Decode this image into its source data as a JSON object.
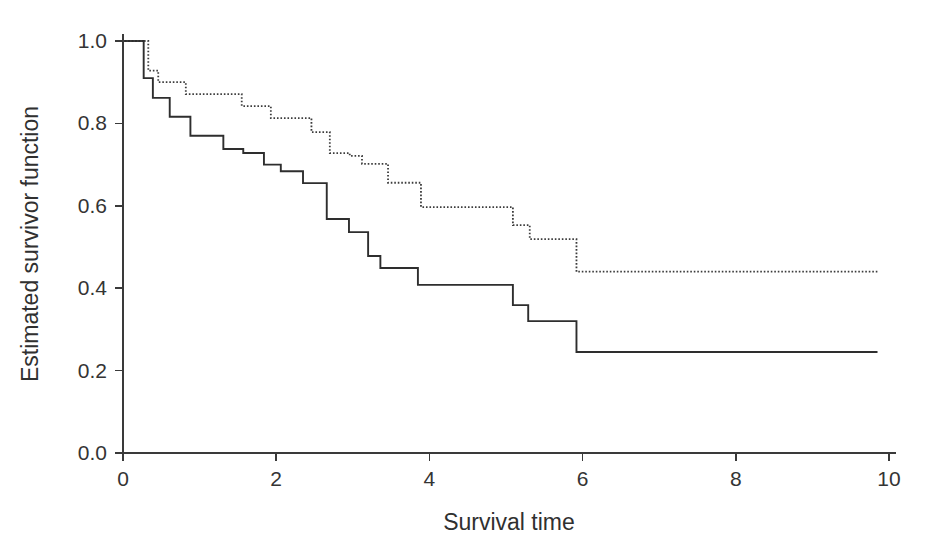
{
  "chart_data": {
    "type": "line",
    "title": "",
    "subtitle": "",
    "xlabel": "Survival time",
    "ylabel": "Estimated survivor function",
    "xlim": [
      0,
      10
    ],
    "ylim": [
      0,
      1.0
    ],
    "xticks": [
      0,
      2,
      4,
      6,
      8,
      10
    ],
    "xtick_labels": [
      "0",
      "2",
      "4",
      "6",
      "8",
      "10"
    ],
    "yticks": [
      0.0,
      0.2,
      0.4,
      0.6,
      0.8,
      1.0
    ],
    "ytick_labels": [
      "0.0",
      "0.2",
      "0.4",
      "0.6",
      "0.8",
      "1.0"
    ],
    "grid": false,
    "legend": "none",
    "step_interpolation": "post",
    "series": [
      {
        "name": "group-1-solid",
        "style": "solid",
        "color": "#2e2e2e",
        "x": [
          0.0,
          0.27,
          0.39,
          0.61,
          0.88,
          1.31,
          1.57,
          1.84,
          2.06,
          2.35,
          2.66,
          2.95,
          3.2,
          3.36,
          3.45,
          3.85,
          5.09,
          5.29,
          5.92,
          9.85
        ],
        "y": [
          1.0,
          0.91,
          0.862,
          0.816,
          0.77,
          0.738,
          0.728,
          0.7,
          0.684,
          0.655,
          0.568,
          0.536,
          0.478,
          0.449,
          0.449,
          0.408,
          0.359,
          0.32,
          0.245,
          0.245
        ]
      },
      {
        "name": "group-2-dotted",
        "style": "dotted",
        "color": "#3c3c3c",
        "x": [
          0.0,
          0.33,
          0.46,
          0.82,
          1.55,
          1.93,
          2.46,
          2.7,
          2.96,
          3.12,
          3.46,
          3.89,
          5.09,
          5.31,
          5.92,
          9.85
        ],
        "y": [
          1.0,
          0.928,
          0.9,
          0.871,
          0.842,
          0.813,
          0.779,
          0.728,
          0.721,
          0.702,
          0.656,
          0.597,
          0.553,
          0.519,
          0.44,
          0.44
        ]
      }
    ]
  },
  "axes": {
    "x_axis_name": "survival-time-axis",
    "y_axis_name": "estimated-survivor-function-axis"
  }
}
